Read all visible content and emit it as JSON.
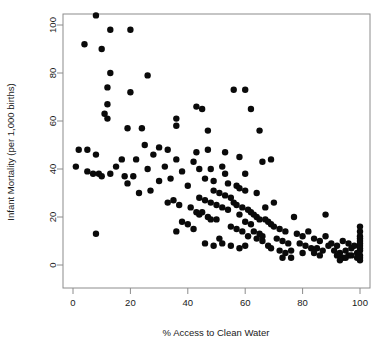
{
  "chart_data": {
    "type": "scatter",
    "title": "",
    "xlabel": "% Access to Clean Water",
    "ylabel": "Infant Mortality (per 1,000 births)",
    "xlim": [
      -2,
      104
    ],
    "ylim": [
      -3,
      108
    ],
    "xticks": [
      0,
      20,
      40,
      60,
      80,
      100
    ],
    "yticks": [
      0,
      20,
      40,
      60,
      80,
      100
    ],
    "xtick_labels": [
      "0",
      "20",
      "40",
      "60",
      "80",
      "100"
    ],
    "ytick_labels": [
      "0",
      "20",
      "40",
      "60",
      "80",
      "100"
    ],
    "grid": false,
    "legend": null,
    "marker": "filled-circle",
    "marker_color": "#0a0a0a",
    "marker_size": 3.2,
    "points": [
      [
        8,
        104
      ],
      [
        13,
        98
      ],
      [
        20,
        98
      ],
      [
        4,
        92
      ],
      [
        10,
        90
      ],
      [
        13,
        80
      ],
      [
        26,
        79
      ],
      [
        12,
        74
      ],
      [
        20,
        72
      ],
      [
        56,
        73
      ],
      [
        60,
        73
      ],
      [
        12,
        67
      ],
      [
        43,
        66
      ],
      [
        45,
        65
      ],
      [
        62,
        65
      ],
      [
        11,
        63
      ],
      [
        12,
        61
      ],
      [
        36,
        61
      ],
      [
        19,
        57
      ],
      [
        24,
        57
      ],
      [
        36,
        58
      ],
      [
        47,
        56
      ],
      [
        65,
        56
      ],
      [
        5,
        48
      ],
      [
        25,
        50
      ],
      [
        30,
        49
      ],
      [
        33,
        48
      ],
      [
        8,
        46
      ],
      [
        28,
        46
      ],
      [
        47,
        48
      ],
      [
        53,
        47
      ],
      [
        17,
        44
      ],
      [
        22,
        44
      ],
      [
        36,
        44
      ],
      [
        42,
        43
      ],
      [
        1,
        41
      ],
      [
        15,
        41
      ],
      [
        32,
        41
      ],
      [
        52,
        41
      ],
      [
        5,
        39
      ],
      [
        7,
        38
      ],
      [
        9,
        38
      ],
      [
        13,
        38
      ],
      [
        10,
        37
      ],
      [
        18,
        37
      ],
      [
        21,
        37
      ],
      [
        2,
        48
      ],
      [
        44,
        40
      ],
      [
        38,
        39
      ],
      [
        27,
        31
      ],
      [
        40,
        33
      ],
      [
        46,
        36
      ],
      [
        49,
        35
      ],
      [
        54,
        34
      ],
      [
        57,
        33
      ],
      [
        58,
        32
      ],
      [
        60,
        31
      ],
      [
        33,
        26
      ],
      [
        35,
        27
      ],
      [
        37,
        25
      ],
      [
        41,
        24
      ],
      [
        43,
        22
      ],
      [
        44,
        21
      ],
      [
        45,
        22
      ],
      [
        47,
        20
      ],
      [
        48,
        19
      ],
      [
        50,
        19
      ],
      [
        42,
        15
      ],
      [
        51,
        11
      ],
      [
        8,
        13
      ],
      [
        53,
        29
      ],
      [
        55,
        28
      ],
      [
        56,
        26
      ],
      [
        57,
        25
      ],
      [
        59,
        24
      ],
      [
        61,
        23
      ],
      [
        62,
        22
      ],
      [
        63,
        21
      ],
      [
        64,
        20
      ],
      [
        65,
        19
      ],
      [
        50,
        25
      ],
      [
        52,
        24
      ],
      [
        54,
        23
      ],
      [
        58,
        21
      ],
      [
        60,
        18
      ],
      [
        62,
        17
      ],
      [
        44,
        28
      ],
      [
        46,
        27
      ],
      [
        48,
        26
      ],
      [
        49,
        31
      ],
      [
        51,
        30
      ],
      [
        55,
        16
      ],
      [
        57,
        15
      ],
      [
        59,
        14
      ],
      [
        63,
        14
      ],
      [
        65,
        13
      ],
      [
        66,
        12
      ],
      [
        67,
        19
      ],
      [
        68,
        18
      ],
      [
        69,
        17
      ],
      [
        61,
        12
      ],
      [
        64,
        11
      ],
      [
        66,
        10
      ],
      [
        46,
        9
      ],
      [
        49,
        8
      ],
      [
        52,
        9
      ],
      [
        55,
        8
      ],
      [
        58,
        7
      ],
      [
        60,
        8
      ],
      [
        70,
        16
      ],
      [
        72,
        15
      ],
      [
        74,
        14
      ],
      [
        71,
        11
      ],
      [
        73,
        10
      ],
      [
        75,
        9
      ],
      [
        72,
        6
      ],
      [
        74,
        5
      ],
      [
        76,
        6
      ],
      [
        68,
        8
      ],
      [
        69,
        7
      ],
      [
        78,
        13
      ],
      [
        80,
        12
      ],
      [
        82,
        14
      ],
      [
        79,
        9
      ],
      [
        81,
        8
      ],
      [
        83,
        7
      ],
      [
        84,
        11
      ],
      [
        86,
        10
      ],
      [
        88,
        12
      ],
      [
        85,
        7
      ],
      [
        87,
        6
      ],
      [
        89,
        8
      ],
      [
        90,
        9
      ],
      [
        92,
        8
      ],
      [
        94,
        10
      ],
      [
        91,
        6
      ],
      [
        93,
        5
      ],
      [
        95,
        6
      ],
      [
        96,
        9
      ],
      [
        97,
        7
      ],
      [
        98,
        8
      ],
      [
        92,
        4
      ],
      [
        94,
        3
      ],
      [
        96,
        4
      ],
      [
        88,
        21
      ],
      [
        77,
        20
      ],
      [
        67,
        24
      ],
      [
        70,
        26
      ],
      [
        64,
        30
      ],
      [
        60,
        38
      ],
      [
        53,
        38
      ],
      [
        48,
        40
      ],
      [
        43,
        47
      ],
      [
        69,
        44
      ],
      [
        66,
        43
      ],
      [
        58,
        45
      ],
      [
        100,
        14
      ],
      [
        100,
        12
      ],
      [
        100,
        10
      ],
      [
        100,
        8
      ],
      [
        100,
        6
      ],
      [
        100,
        4
      ],
      [
        100,
        3
      ],
      [
        100,
        2
      ],
      [
        100,
        16
      ],
      [
        100,
        11
      ],
      [
        100,
        9
      ],
      [
        100,
        7
      ],
      [
        99,
        5
      ],
      [
        99,
        3
      ],
      [
        97,
        4
      ],
      [
        95,
        3
      ],
      [
        93,
        2
      ],
      [
        86,
        4
      ],
      [
        84,
        5
      ],
      [
        80,
        5
      ],
      [
        76,
        3
      ],
      [
        73,
        3
      ],
      [
        30,
        35
      ],
      [
        34,
        36
      ],
      [
        26,
        40
      ],
      [
        23,
        30
      ],
      [
        19,
        34
      ],
      [
        40,
        17
      ],
      [
        38,
        18
      ],
      [
        36,
        14
      ]
    ]
  },
  "axis": {
    "x_title": "% Access to Clean Water",
    "y_title": "Infant Mortality (per 1,000 births)"
  }
}
